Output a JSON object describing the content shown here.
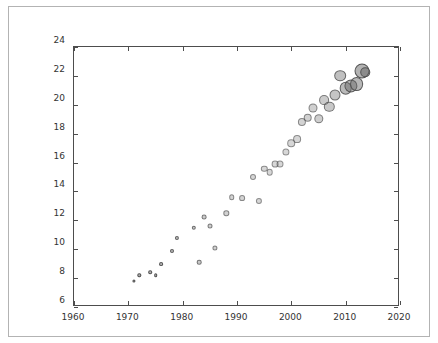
{
  "figure": {
    "background_color": "#ffffff",
    "border_color": "#b3b3b3",
    "axis_color": "#4d4d4d",
    "marker_fill_color": "#666666",
    "marker_edge_color": "#4d4d4d"
  },
  "chart_data": {
    "type": "scatter",
    "title": "",
    "xlabel": "",
    "ylabel": "",
    "xlim": [
      1960,
      2020
    ],
    "ylim": [
      6,
      24
    ],
    "xticks": [
      1960,
      1970,
      1980,
      1990,
      2000,
      2010,
      2020
    ],
    "yticks": [
      6,
      8,
      10,
      12,
      14,
      16,
      18,
      20,
      22,
      24
    ],
    "xtick_labels": [
      "1960",
      "1970",
      "1980",
      "1990",
      "2000",
      "2010",
      "2020"
    ],
    "ytick_labels": [
      "6",
      "8",
      "10",
      "12",
      "14",
      "16",
      "18",
      "20",
      "22",
      "24"
    ],
    "grid": false,
    "legend": null,
    "marker_style": "circle",
    "note": "Marker size and opacity increase with later years",
    "x": [
      1971,
      1972,
      1974,
      1975,
      1976,
      1978,
      1979,
      1982,
      1983,
      1984,
      1985,
      1986,
      1988,
      1989,
      1991,
      1993,
      1994,
      1995,
      1996,
      1997,
      1998,
      1999,
      2000,
      2001,
      2002,
      2003,
      2004,
      2005,
      2006,
      2007,
      2008,
      2009,
      2010,
      2011,
      2012,
      2013,
      2013.6
    ],
    "y": [
      7.8,
      8.2,
      8.4,
      8.2,
      8.95,
      9.85,
      10.8,
      11.5,
      9.1,
      12.25,
      11.6,
      10.1,
      12.5,
      13.6,
      13.55,
      15.0,
      13.35,
      15.55,
      15.35,
      15.9,
      15.9,
      16.75,
      17.35,
      17.65,
      18.8,
      19.1,
      19.75,
      19.05,
      20.3,
      19.85,
      20.65,
      22.0,
      21.15,
      21.3,
      21.45,
      22.35,
      22.25
    ],
    "sizes": [
      3.2,
      3.4,
      3.6,
      3.6,
      3.8,
      4.0,
      4.2,
      4.4,
      4.6,
      4.8,
      5.0,
      5.2,
      5.4,
      5.6,
      5.8,
      6.0,
      6.2,
      6.4,
      6.6,
      6.8,
      7.0,
      7.2,
      7.6,
      7.8,
      8.2,
      8.6,
      9.0,
      9.4,
      9.8,
      10.4,
      11.0,
      11.6,
      12.6,
      13.2,
      13.8,
      15.0,
      9.5
    ],
    "opacities": [
      0.85,
      0.85,
      0.82,
      0.82,
      0.8,
      0.75,
      0.72,
      0.62,
      0.58,
      0.55,
      0.52,
      0.5,
      0.48,
      0.46,
      0.45,
      0.44,
      0.43,
      0.43,
      0.42,
      0.42,
      0.42,
      0.42,
      0.43,
      0.44,
      0.46,
      0.48,
      0.5,
      0.52,
      0.55,
      0.58,
      0.62,
      0.66,
      0.72,
      0.74,
      0.76,
      0.8,
      0.8
    ]
  }
}
